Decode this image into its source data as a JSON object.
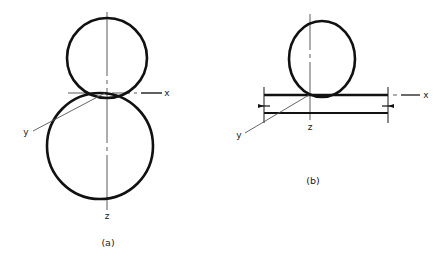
{
  "figure": {
    "background_color": "#ffffff",
    "line_color": "#111111",
    "thin_line_color": "#555555",
    "panels": [
      {
        "id": "panel-a",
        "caption": "(a)",
        "axis_labels": {
          "x": "x",
          "y": "y",
          "z": "z"
        },
        "shapes": [
          {
            "name": "upper-sphere-circle",
            "type": "circle",
            "cx": 107,
            "cy": 58,
            "r": 40
          },
          {
            "name": "lower-sphere-circle",
            "type": "circle",
            "cx": 100,
            "cy": 146,
            "r": 53
          }
        ],
        "axes": {
          "x_axis": {
            "from_x": 68,
            "to_x": 162,
            "y": 93,
            "style": "center-line"
          },
          "z_axis": {
            "x": 107,
            "from_y": 12,
            "to_y": 210,
            "style": "center-line"
          },
          "y_axis": {
            "from_x": 107,
            "from_y": 93,
            "to_x": 33,
            "to_y": 131,
            "style": "thin"
          }
        },
        "origin": {
          "x": 107,
          "y": 93
        }
      },
      {
        "id": "panel-b",
        "caption": "(b)",
        "axis_labels": {
          "x": "x",
          "y": "y",
          "z": "z"
        },
        "shapes": [
          {
            "name": "sphere-circle",
            "type": "circle",
            "cx": 322,
            "cy": 59,
            "rx": 33,
            "ry": 38
          },
          {
            "name": "upper-band-edge",
            "type": "line",
            "x1": 264,
            "y1": 95,
            "x2": 388,
            "y2": 95
          },
          {
            "name": "lower-band-edge",
            "type": "line",
            "x1": 264,
            "y1": 113,
            "x2": 388,
            "y2": 113
          },
          {
            "name": "left-extension-line",
            "type": "line",
            "x1": 264,
            "y1": 88,
            "x2": 264,
            "y2": 122
          },
          {
            "name": "right-extension-line",
            "type": "line",
            "x1": 388,
            "y1": 88,
            "x2": 388,
            "y2": 122
          }
        ],
        "axes": {
          "x_axis": {
            "from_x": 388,
            "to_x": 420,
            "y": 95,
            "style": "center-line"
          },
          "z_axis": {
            "x": 310,
            "from_y": 14,
            "to_y": 120,
            "style": "center-line"
          },
          "y_axis": {
            "from_x": 310,
            "from_y": 95,
            "to_x": 245,
            "to_y": 133,
            "style": "thin"
          }
        },
        "origin": {
          "x": 310,
          "y": 95
        },
        "dimension_arrows": [
          {
            "name": "left-dimension-arrow",
            "x": 264,
            "y": 106
          },
          {
            "name": "right-dimension-arrow",
            "x": 388,
            "y": 106
          }
        ]
      }
    ]
  }
}
